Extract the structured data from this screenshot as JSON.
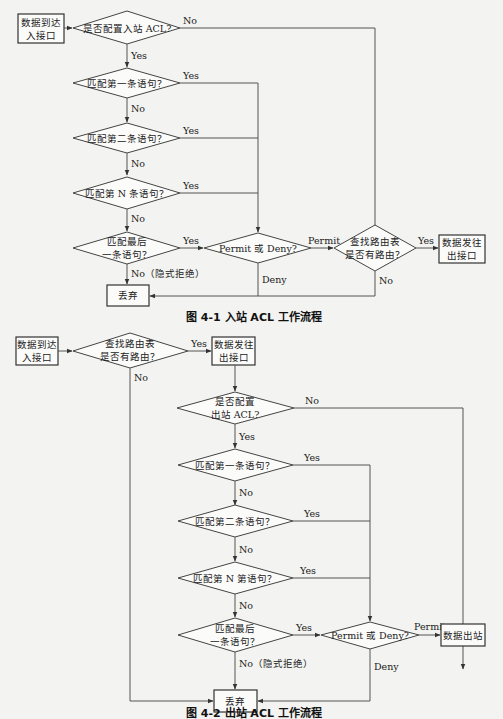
{
  "figure1": {
    "caption": "图 4-1   入站 ACL 工作流程",
    "nodes": {
      "start": [
        "数据到达",
        "入接口"
      ],
      "acl_configured": "是否配置入站 ACL?",
      "match1": "匹配第一条语句？",
      "match2": "匹配第二条语句？",
      "matchN": "匹配第 N 条语句？",
      "match_last": [
        "匹配最后",
        "一条语句？"
      ],
      "permit_deny": "Permit 或 Deny?",
      "route_lookup": [
        "查找路由表",
        "是否有路由？"
      ],
      "forward": [
        "数据发往",
        "出接口"
      ],
      "discard": "丢弃"
    },
    "edges": {
      "no": "No",
      "yes": "Yes",
      "no_implicit": "No（隐式拒绝）",
      "permit": "Permit",
      "deny": "Deny"
    }
  },
  "figure2": {
    "caption": "图 4-2   出站 ACL 工作流程",
    "nodes": {
      "start": [
        "数据到达",
        "入接口"
      ],
      "route_lookup": [
        "查找路由表",
        "是否有路由？"
      ],
      "forward": [
        "数据发往",
        "出接口"
      ],
      "acl_configured": [
        "是否配置",
        "出站 ACL?"
      ],
      "match1": "匹配第一条语句？",
      "match2": "匹配第二条语句？",
      "matchN": "匹配第 N 第语句？",
      "match_last": [
        "匹配最后",
        "一条语句？"
      ],
      "permit_deny": "Permit 或 Deny?",
      "egress": "数据出站",
      "discard": "丢弃"
    },
    "edges": {
      "no": "No",
      "yes": "Yes",
      "no_implicit": "No（隐式拒绝）",
      "permit": "Permit",
      "deny": "Deny"
    }
  }
}
